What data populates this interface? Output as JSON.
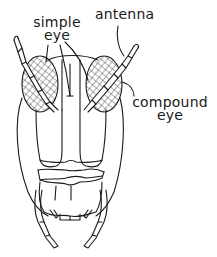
{
  "diagram": {
    "colors": {
      "ink": "#1a1a1a",
      "background": "#ffffff"
    },
    "labels": {
      "simple_eye": {
        "line1": "simple",
        "line2": "eye"
      },
      "antenna": {
        "text": "antenna"
      },
      "compound_eye": {
        "line1": "compound",
        "line2": "eye"
      }
    }
  }
}
